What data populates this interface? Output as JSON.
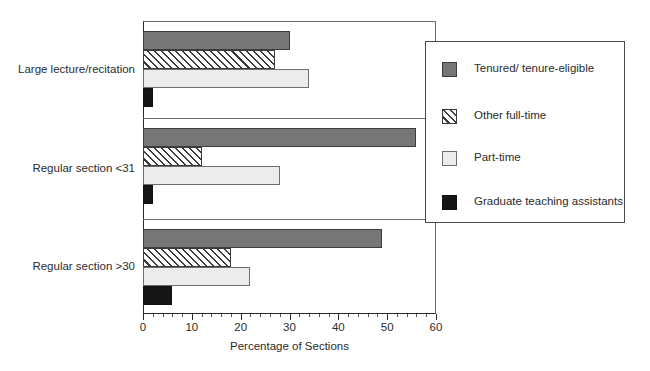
{
  "chart_data": {
    "type": "bar",
    "orientation": "horizontal",
    "title": "",
    "xlabel": "Percentage of Sections",
    "ylabel": "",
    "xlim": [
      0,
      60
    ],
    "xticks": [
      0,
      10,
      20,
      30,
      40,
      50,
      60
    ],
    "xtick_labels": [
      "0",
      "10",
      "20",
      "30",
      "40",
      "50",
      "60"
    ],
    "minor_tick_step": 2,
    "grid": false,
    "legend_position": "right-inside",
    "categories": [
      "Large lecture/recitation",
      "Regular section <31",
      "Regular section >30"
    ],
    "series": [
      {
        "name": "Tenured/ tenure-eligible",
        "key": "s0",
        "color": "#767676",
        "fill": "solid",
        "values": [
          30,
          56,
          49
        ]
      },
      {
        "name": "Other full-time",
        "key": "s1",
        "color": "#ffffff",
        "fill": "hatch",
        "values": [
          27,
          12,
          18
        ]
      },
      {
        "name": "Part-time",
        "key": "s2",
        "color": "#ececec",
        "fill": "solid",
        "values": [
          34,
          28,
          22
        ]
      },
      {
        "name": "Graduate teaching assistants",
        "key": "s3",
        "color": "#151515",
        "fill": "solid",
        "values": [
          2,
          2,
          6
        ]
      }
    ]
  },
  "legend": {
    "items": [
      {
        "label": "Tenured/ tenure-eligible"
      },
      {
        "label": "Other full-time"
      },
      {
        "label": "Part-time"
      },
      {
        "label": "Graduate teaching assistants"
      }
    ]
  }
}
